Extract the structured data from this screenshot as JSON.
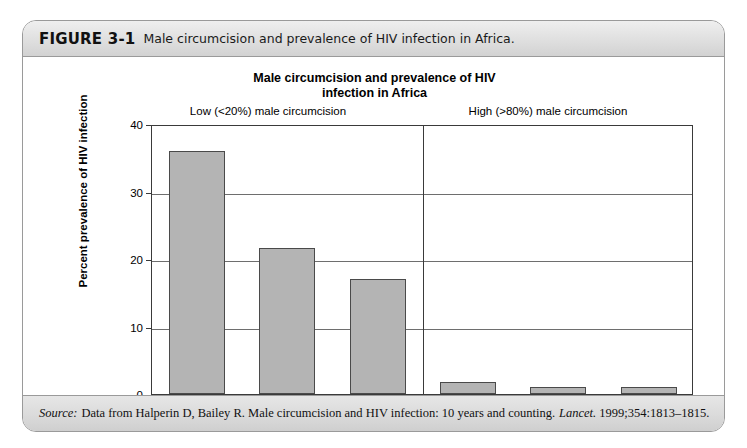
{
  "figure": {
    "number": "FIGURE 3-1",
    "caption": "Male circumcision and prevalence of HIV infection in Africa."
  },
  "source": {
    "label": "Source:",
    "text": "Data from Halperin D, Bailey R. Male circumcision and HIV infection: 10 years and counting.",
    "journal": "Lancet.",
    "citation": "1999;354:1813–1815."
  },
  "chart_data": {
    "type": "bar",
    "title": "Male circumcision and prevalence of HIV\ninfection in Africa",
    "title_line1": "Male circumcision and prevalence of HIV",
    "title_line2": "infection in Africa",
    "xlabel": "",
    "ylabel": "Percent prevalence of HIV infection",
    "ylim": [
      0,
      40
    ],
    "yticks": [
      0,
      10,
      20,
      30,
      40
    ],
    "ytick_labels": [
      "0",
      "10",
      "20",
      "30",
      "40"
    ],
    "grid": true,
    "legend": "none",
    "bar_color": "#b4b4b4",
    "bar_edge_color": "#4a4a4a",
    "axis_color": "#3a3a3a",
    "categories": [
      "Botswana",
      "Lesotho",
      "Zambia",
      "Guinea",
      "Sierra Leone",
      "Senegal"
    ],
    "values": [
      36.0,
      21.7,
      17.0,
      1.8,
      1.0,
      1.0
    ],
    "groups": [
      {
        "label": "Low (<20%) male circumcision",
        "categories": [
          "Botswana",
          "Lesotho",
          "Zambia"
        ]
      },
      {
        "label": "High (>80%) male circumcision",
        "categories": [
          "Guinea",
          "Sierra Leone",
          "Senegal"
        ]
      }
    ],
    "group_divider_after_index": 2
  }
}
